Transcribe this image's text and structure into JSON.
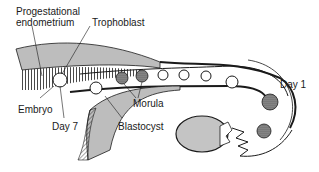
{
  "diagram": {
    "labels": {
      "progestational_line1": "Progestational",
      "progestational_line2": "endometrium",
      "trophoblast": "Trophoblast",
      "embryo": "Embryo",
      "day7": "Day 7",
      "morula": "Morula",
      "blastocyst": "Blastocyst",
      "day1": "Day 1"
    },
    "colors": {
      "ink": "#1a1a1a",
      "gray_fill": "#bdbdbd",
      "ovary_fill": "#c4c4c4",
      "background": "#ffffff"
    }
  }
}
